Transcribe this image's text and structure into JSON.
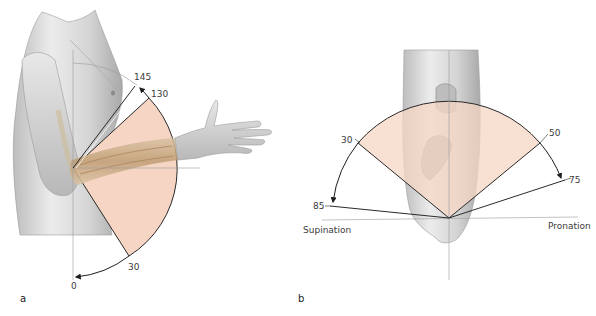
{
  "figure": {
    "colors": {
      "range_fill": "#f6d5c4",
      "skin": "#d9d9d9",
      "bone": "#c9ad88",
      "line": "#2a2a2a",
      "reference_line": "#9a9a9a",
      "label": "#3a3a3a"
    }
  },
  "panels": [
    {
      "id": "a",
      "label": "a",
      "description": "Elbow flexion/extension",
      "angles": [
        {
          "value": "145",
          "meaning": "maximum flexion"
        },
        {
          "value": "130",
          "meaning": "active flexion"
        },
        {
          "value": "30",
          "meaning": "functional range limit"
        },
        {
          "value": "0",
          "meaning": "neutral / extension"
        }
      ]
    },
    {
      "id": "b",
      "label": "b",
      "description": "Forearm pronation/supination",
      "direction_labels": {
        "left": "Supination",
        "right": "Pronation"
      },
      "angles": [
        {
          "value": "30",
          "side": "supination",
          "meaning": "functional range"
        },
        {
          "value": "85",
          "side": "supination",
          "meaning": "maximum"
        },
        {
          "value": "50",
          "side": "pronation",
          "meaning": "functional range"
        },
        {
          "value": "75",
          "side": "pronation",
          "meaning": "maximum"
        }
      ]
    }
  ]
}
